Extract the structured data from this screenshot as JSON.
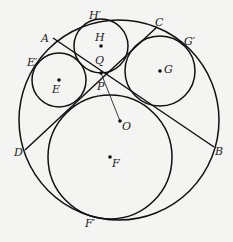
{
  "diagram": {
    "type": "geometry",
    "colors": {
      "background": "#f4f4f2",
      "stroke": "#111111"
    },
    "circles": [
      {
        "name": "O",
        "cx": 119,
        "cy": 120,
        "r": 100
      },
      {
        "name": "E",
        "cx": 59,
        "cy": 80,
        "r": 27
      },
      {
        "name": "H",
        "cx": 101,
        "cy": 46,
        "r": 27
      },
      {
        "name": "G",
        "cx": 160,
        "cy": 71,
        "r": 35
      },
      {
        "name": "F",
        "cx": 110,
        "cy": 157,
        "r": 62
      }
    ],
    "chords": [
      {
        "name": "AB",
        "from": [
          53,
          38
        ],
        "to": [
          214,
          147
        ]
      },
      {
        "name": "CD",
        "from": [
          157,
          27
        ],
        "to": [
          25,
          150
        ]
      }
    ],
    "segments": [
      {
        "name": "QO",
        "from": [
          101,
          73
        ],
        "to": [
          120,
          121
        ]
      }
    ],
    "points": [
      {
        "name": "O",
        "x": 120,
        "y": 121
      },
      {
        "name": "E",
        "x": 59,
        "y": 80
      },
      {
        "name": "H",
        "x": 101,
        "y": 46
      },
      {
        "name": "G",
        "x": 160,
        "y": 71
      },
      {
        "name": "F",
        "x": 110,
        "y": 157
      },
      {
        "name": "Q",
        "x": 101,
        "y": 73
      }
    ],
    "labels": {
      "A": "A",
      "B": "B",
      "C": "C",
      "D": "D",
      "E": "E",
      "E_prime": "E′",
      "F": "F",
      "F_prime": "F′",
      "G": "G",
      "G_prime": "G′",
      "H": "H",
      "H_prime": "H′",
      "O": "O",
      "P": "P",
      "Q": "Q"
    }
  }
}
